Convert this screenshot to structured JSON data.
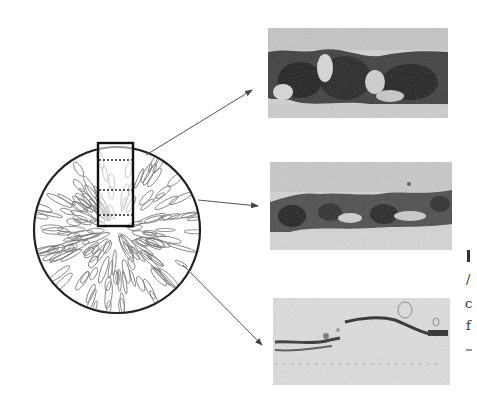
{
  "figure": {
    "type": "schematic with micrographs",
    "colors": {
      "line": "#222222",
      "arrow": "#555555",
      "sketch": "#777777",
      "photo_bg": "#c9c9c9",
      "photo_dark": "#2a2a2a"
    },
    "cross_section": {
      "shape": "circle",
      "center": [
        117,
        230
      ],
      "radius": 83,
      "sample_box": {
        "x": 98,
        "y": 143,
        "w": 35,
        "h": 83,
        "dotted_lines_y": [
          160,
          190,
          215
        ]
      }
    },
    "arrows": [
      {
        "from": [
          146,
          155
        ],
        "to": [
          252,
          90
        ],
        "target": "photo-top"
      },
      {
        "from": [
          198,
          200
        ],
        "to": [
          258,
          206
        ],
        "target": "photo-middle"
      },
      {
        "from": [
          183,
          265
        ],
        "to": [
          262,
          345
        ],
        "target": "photo-bottom"
      }
    ],
    "photos": [
      {
        "name": "photo-top",
        "x": 268,
        "y": 28,
        "w": 180,
        "h": 90,
        "density": "heavy"
      },
      {
        "name": "photo-middle",
        "x": 270,
        "y": 162,
        "w": 182,
        "h": 88,
        "density": "medium"
      },
      {
        "name": "photo-bottom",
        "x": 273,
        "y": 298,
        "w": 177,
        "h": 87,
        "density": "light"
      }
    ],
    "cropped_text_fragments": [
      "I",
      "/",
      "c",
      "f",
      "-"
    ]
  }
}
